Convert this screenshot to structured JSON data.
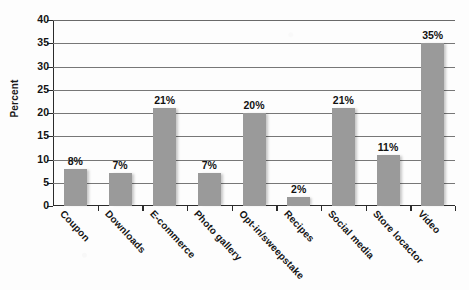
{
  "chart_data": {
    "type": "bar",
    "title": "",
    "xlabel": "",
    "ylabel": "Percent",
    "categories": [
      "Coupon",
      "Downloads",
      "E-commerce",
      "Photo gallery",
      "Opt-in/sweepstake",
      "Recipes",
      "Social media",
      "Store locactor",
      "Video"
    ],
    "values": [
      8,
      7,
      21,
      7,
      20,
      2,
      21,
      11,
      35
    ],
    "value_labels": [
      "8%",
      "7%",
      "21%",
      "7%",
      "20%",
      "2%",
      "21%",
      "11%",
      "35%"
    ],
    "ylim": [
      0,
      40
    ],
    "ytick_labels": [
      "0",
      "5",
      "10",
      "15",
      "20",
      "25",
      "30",
      "35",
      "40"
    ],
    "ytick_values": [
      0,
      5,
      10,
      15,
      20,
      25,
      30,
      35,
      40
    ],
    "grid": true,
    "grid_axis": "y",
    "legend": false,
    "legend_position": "none",
    "bar_color": "#9a9a9a",
    "axis_color": "#2b2b2b",
    "gridline_color": "#777777",
    "background_color": "#fdfdfd",
    "text_color": "#141414"
  }
}
